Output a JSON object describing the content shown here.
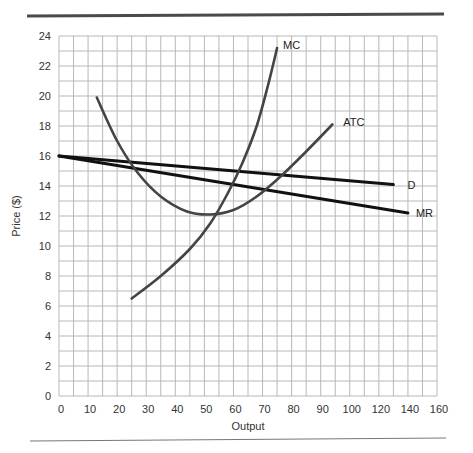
{
  "chart_data": {
    "type": "line",
    "title": "",
    "xlabel": "Output",
    "ylabel": "Price ($)",
    "xlim": [
      0,
      160
    ],
    "ylim": [
      0,
      24
    ],
    "grid": true,
    "x_ticks": [
      "0",
      "10",
      "20",
      "30",
      "40",
      "50",
      "60",
      "70",
      "80",
      "90",
      "100",
      "120",
      "140",
      "160"
    ],
    "y_ticks": [
      "0",
      "2",
      "4",
      "6",
      "8",
      "10",
      "12",
      "14",
      "16",
      "18",
      "20",
      "22",
      "24"
    ],
    "series": [
      {
        "name": "D",
        "x": [
          0,
          130
        ],
        "y": [
          16,
          14.1
        ],
        "color": "#111111"
      },
      {
        "name": "MR",
        "x": [
          0,
          140
        ],
        "y": [
          16,
          12.2
        ],
        "color": "#111111"
      },
      {
        "name": "MC",
        "x": [
          25,
          35,
          45,
          52,
          58,
          63,
          68,
          72,
          75
        ],
        "y": [
          6.5,
          8.0,
          9.8,
          11.5,
          13.5,
          15.5,
          18.0,
          20.8,
          23.2
        ],
        "color": "#444444"
      },
      {
        "name": "ATC",
        "x": [
          13,
          20,
          27,
          35,
          44,
          52,
          60,
          68,
          76,
          85,
          94
        ],
        "y": [
          19.9,
          17.0,
          14.9,
          13.3,
          12.3,
          12.1,
          12.4,
          13.3,
          14.6,
          16.3,
          18.1
        ],
        "color": "#444444"
      }
    ],
    "annotations": [
      "MC",
      "ATC",
      "D",
      "MR"
    ]
  },
  "labels": {
    "x_axis_title": "Output",
    "y_axis_title": "Price ($)",
    "mc": "MC",
    "atc": "ATC",
    "d": "D",
    "mr": "MR"
  }
}
